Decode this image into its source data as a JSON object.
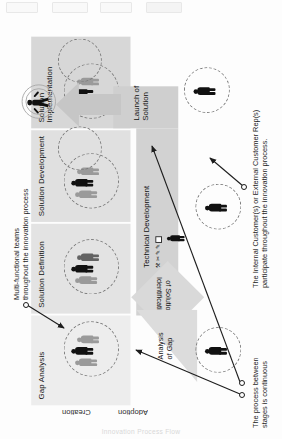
{
  "figure": {
    "orientation": "rotated-90-clockwise-scan",
    "footer_caption": "Innovation Process Flow"
  },
  "stages": [
    {
      "id": "gap-analysis",
      "label": "Gap Analysis"
    },
    {
      "id": "solution-definition",
      "label": "Solution Definition"
    },
    {
      "id": "solution-development",
      "label": "Solution Development"
    },
    {
      "id": "solution-implementation",
      "label": "Solution Implementation"
    }
  ],
  "bands": {
    "analysis_of_gap": "Analysis\nof Gap",
    "analysis_of_gap_line1": "Analysis",
    "analysis_of_gap_line2": "of Gap",
    "identification_line1": "Identification",
    "identification_line2": "of Solution",
    "technical_development": "Technical Development",
    "launch_line1": "Launch of",
    "launch_line2": "Solution"
  },
  "axes": {
    "creation": "Creation",
    "adoption": "Adoption"
  },
  "annotations": [
    {
      "id": "multi-functional-teams",
      "line1": "Multi-functional teams",
      "line2": "throughout the innovation process"
    },
    {
      "id": "customer-participation",
      "line1": "The Internal Customer(s) or External Customer Rep(s)",
      "line2": "participate throughout the innovation process."
    },
    {
      "id": "continuous-process",
      "line1": "The process between",
      "line2": "stages is continuous"
    }
  ],
  "icons": {
    "technical_tools": [
      "wrench-icon",
      "scissors-icon",
      "pencil-icon",
      "pencil-icon",
      "square-icon"
    ],
    "celebration": "celebrating-person-icon",
    "team_circle": "dashed-team-circle-icon",
    "customer_figure": "customer-person-icon"
  },
  "colors": {
    "panel": "#e3e3e3",
    "panel_light": "#ededed",
    "corridor": "#d2d2d2",
    "diamond": "#d9d9d9",
    "person_dark": "#111111",
    "person_grey": "#9a9a9a",
    "ink": "#1d1d1d"
  }
}
